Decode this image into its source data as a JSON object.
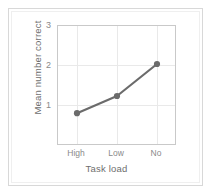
{
  "chart_data": {
    "type": "line",
    "title": "",
    "xlabel": "Task load",
    "ylabel": "Mean number correct",
    "categories": [
      "High",
      "Low",
      "No"
    ],
    "values": [
      0.82,
      1.25,
      2.05
    ],
    "series": [
      {
        "name": "Mean number correct",
        "values": [
          0.82,
          1.25,
          2.05
        ]
      }
    ],
    "ylim": [
      0,
      3
    ],
    "ytick_labels": [
      "1",
      "2",
      "3"
    ],
    "ytick_values": [
      1,
      2,
      3
    ],
    "xtick_labels": [
      "High",
      "Low",
      "No"
    ],
    "grid": true,
    "legend": "none",
    "line_color": "#6b6b6b",
    "marker_color": "#6b6b6b",
    "marker_style": "circle",
    "grid_color": "#e9e9e9",
    "axis_color": "#c9c9c9",
    "text_color": "#8a8a8a",
    "title_color": "#6e6e6e",
    "frame_color": "#d8d8d8",
    "background_color": "#ffffff"
  },
  "axes": {
    "y_ticks": [
      {
        "label": "3",
        "value": 3
      },
      {
        "label": "2",
        "value": 2
      },
      {
        "label": "1",
        "value": 1
      }
    ],
    "x_ticks": [
      {
        "label": "High",
        "value": 0
      },
      {
        "label": "Low",
        "value": 1
      },
      {
        "label": "No",
        "value": 2
      }
    ],
    "x_title": "Task load",
    "y_title": "Mean number correct"
  }
}
